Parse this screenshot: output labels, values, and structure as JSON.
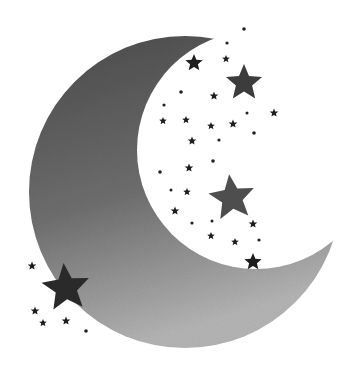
{
  "image": {
    "subject": "crescent moon with stars",
    "background_color": "#ffffff",
    "moon": {
      "outer": {
        "cx": 185,
        "cy": 192,
        "r": 156
      },
      "inner_cut": {
        "cx": 256,
        "cy": 150,
        "r": 119
      },
      "gradient_top": "#4a4a4a",
      "gradient_bottom": "#b4b4b4"
    },
    "large_stars": [
      {
        "name": "star-upper-right",
        "x": 244,
        "y": 83,
        "r": 19,
        "color": "#3c3c3c"
      },
      {
        "name": "star-middle-right",
        "x": 232,
        "y": 198,
        "r": 24,
        "color": "#4e4e4e"
      },
      {
        "name": "star-lower-left",
        "x": 66,
        "y": 288,
        "r": 25,
        "color": "#2a2a2a"
      }
    ],
    "small_stars": [
      {
        "x": 194,
        "y": 63,
        "r": 9
      },
      {
        "x": 253,
        "y": 262,
        "r": 9
      },
      {
        "x": 226,
        "y": 59,
        "r": 4
      },
      {
        "x": 214,
        "y": 96,
        "r": 4.5
      },
      {
        "x": 186,
        "y": 120,
        "r": 4
      },
      {
        "x": 163,
        "y": 121,
        "r": 4
      },
      {
        "x": 233,
        "y": 124,
        "r": 4.5
      },
      {
        "x": 211,
        "y": 126,
        "r": 4
      },
      {
        "x": 274,
        "y": 113,
        "r": 4.5
      },
      {
        "x": 192,
        "y": 141,
        "r": 4.5
      },
      {
        "x": 189,
        "y": 168,
        "r": 4.5
      },
      {
        "x": 187,
        "y": 192,
        "r": 4
      },
      {
        "x": 175,
        "y": 211,
        "r": 4.5
      },
      {
        "x": 253,
        "y": 224,
        "r": 4.5
      },
      {
        "x": 211,
        "y": 236,
        "r": 4
      },
      {
        "x": 235,
        "y": 242,
        "r": 4
      },
      {
        "x": 32,
        "y": 266,
        "r": 4.5
      },
      {
        "x": 35,
        "y": 311,
        "r": 4.5
      },
      {
        "x": 66,
        "y": 321,
        "r": 4.5
      },
      {
        "x": 43,
        "y": 323,
        "r": 4
      }
    ],
    "dots": [
      {
        "x": 244,
        "y": 29,
        "r": 1.8
      },
      {
        "x": 227,
        "y": 43,
        "r": 1.6
      },
      {
        "x": 181,
        "y": 92,
        "r": 1.8
      },
      {
        "x": 164,
        "y": 105,
        "r": 1.6
      },
      {
        "x": 247,
        "y": 113,
        "r": 1.5
      },
      {
        "x": 254,
        "y": 133,
        "r": 1.8
      },
      {
        "x": 219,
        "y": 140,
        "r": 1.6
      },
      {
        "x": 213,
        "y": 161,
        "r": 1.8
      },
      {
        "x": 160,
        "y": 172,
        "r": 1.8
      },
      {
        "x": 171,
        "y": 190,
        "r": 1.5
      },
      {
        "x": 192,
        "y": 223,
        "r": 1.6
      },
      {
        "x": 212,
        "y": 221,
        "r": 1.5
      },
      {
        "x": 259,
        "y": 240,
        "r": 1.6
      },
      {
        "x": 86,
        "y": 331,
        "r": 1.8
      }
    ]
  }
}
